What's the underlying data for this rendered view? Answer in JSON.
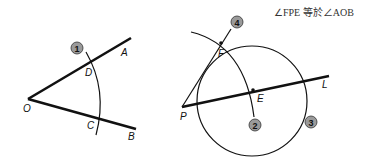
{
  "caption": "∠FPE 等於∠AOB",
  "left_figure": {
    "points": {
      "O": "O",
      "A": "A",
      "B": "B",
      "C": "C",
      "D": "D"
    },
    "step_markers": [
      "1"
    ]
  },
  "right_figure": {
    "points": {
      "P": "P",
      "L": "L",
      "E": "E",
      "F": "F"
    },
    "step_markers": [
      "2",
      "3",
      "4"
    ]
  }
}
